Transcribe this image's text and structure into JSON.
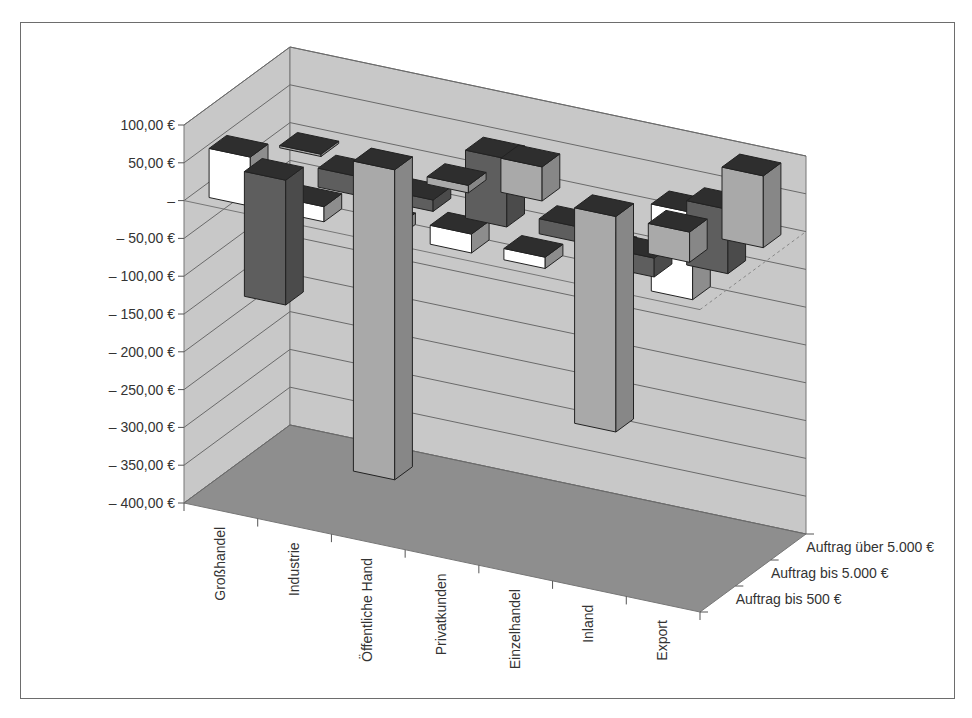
{
  "chart_data": {
    "type": "bar",
    "subtype": "3d-column",
    "title": "",
    "xlabel": "",
    "ylabel": "",
    "categories": [
      "Großhandel",
      "Industrie",
      "Öffentliche Hand",
      "Privatkunden",
      "Einzelhandel",
      "Inland",
      "Export"
    ],
    "series": [
      {
        "name": "Auftrag bis 500 €",
        "color": "#a9a9a9",
        "values": [
          -3,
          -410,
          -10,
          45,
          -285,
          -40,
          95
        ]
      },
      {
        "name": "Auftrag bis 5.000 €",
        "color": "#5e5e5e",
        "values": [
          -165,
          25,
          15,
          90,
          20,
          -25,
          85
        ]
      },
      {
        "name": "Auftrag über 5.000 €",
        "color": "#ffffff",
        "values": [
          65,
          20,
          15,
          25,
          15,
          45,
          115
        ]
      }
    ],
    "ylim": [
      -400,
      100
    ],
    "y_ticks": [
      100,
      50,
      0,
      -50,
      -100,
      -150,
      -200,
      -250,
      -300,
      -350,
      -400
    ],
    "y_tick_labels": [
      "100,00 €",
      "50,00 €",
      "–",
      "– 50,00 €",
      "– 100,00 €",
      "– 150,00 €",
      "– 200,00 €",
      "– 250,00 €",
      "– 300,00 €",
      "– 350,00 €",
      "– 400,00 €"
    ],
    "depth_labels": [
      "Auftrag über 5.000 €",
      "Auftrag bis 5.000 €",
      "Auftrag bis 500 €"
    ],
    "grid": true,
    "legend": "none (series named on depth axis)",
    "colors": {
      "wall": "#c8c8c8",
      "floor": "#8e8e8e",
      "gridline": "#6a6a6a",
      "frame": "#6d6d6d"
    }
  }
}
